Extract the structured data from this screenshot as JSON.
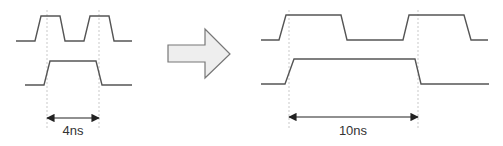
{
  "diagram": {
    "colors": {
      "waveform": "#555555",
      "guide": "#bbbbbb",
      "dimension": "#222222",
      "arrow_fill": "#eeeeee",
      "arrow_stroke": "#777777",
      "text": "#333333"
    },
    "left": {
      "top_wave": "16,41 35,41 41,16 60,16 65,41 84,41 90,16 109,16 114,41 132,41",
      "bottom_wave": "25,85 44,85 50,61 96,61 102,85 132,85",
      "guides": [
        47,
        99
      ],
      "dimension": {
        "x1": 47,
        "x2": 99,
        "y": 118,
        "label": "4ns",
        "label_x": 73,
        "label_y": 135
      }
    },
    "transition_arrow": {
      "points": "168,45 205,45 205,29 230,54 205,78 205,62 168,62"
    },
    "right": {
      "top_wave": "261,40 279,40 286,15 341,15 347,40 403,40 409,15 464,15 471,40 488,40",
      "bottom_wave": "261,84 285,84 294,59 415,59 421,84 489,84",
      "guides": [
        289,
        418
      ],
      "dimension": {
        "x1": 289,
        "x2": 418,
        "y": 117,
        "label": "10ns",
        "label_x": 353,
        "label_y": 135
      }
    }
  }
}
